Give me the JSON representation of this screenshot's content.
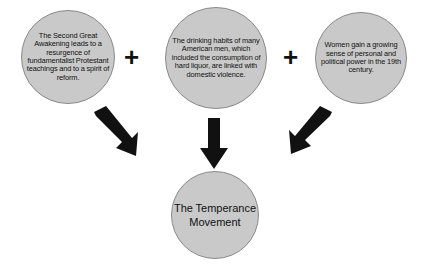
{
  "diagram": {
    "type": "cause-and-effect",
    "colors": {
      "node_fill": "#c9c9c9",
      "node_stroke": "#8a8a8a",
      "text": "#111111",
      "arrow": "#111111",
      "background": "#ffffff"
    },
    "causes": [
      {
        "id": "cause-1",
        "text": "The Second Great Awakening leads to a resurgence of fundamentalist Protestant teachings and to a spirit of reform."
      },
      {
        "id": "cause-2",
        "text": "The drinking habits of many American men, which included the consumption of hard liquor, are linked with domestic violence."
      },
      {
        "id": "cause-3",
        "text": "Women gain a growing sense of personal and political power in the 19th century."
      }
    ],
    "operators": [
      {
        "id": "plus-1",
        "symbol": "+"
      },
      {
        "id": "plus-2",
        "symbol": "+"
      }
    ],
    "result": {
      "id": "result-node",
      "text": "The Temperance Movement"
    },
    "arrows": [
      {
        "id": "arrow-left",
        "direction": "down-right",
        "from": "cause-1",
        "to": "result-node"
      },
      {
        "id": "arrow-mid",
        "direction": "down",
        "from": "cause-2",
        "to": "result-node"
      },
      {
        "id": "arrow-right",
        "direction": "down-left",
        "from": "cause-3",
        "to": "result-node"
      }
    ]
  }
}
